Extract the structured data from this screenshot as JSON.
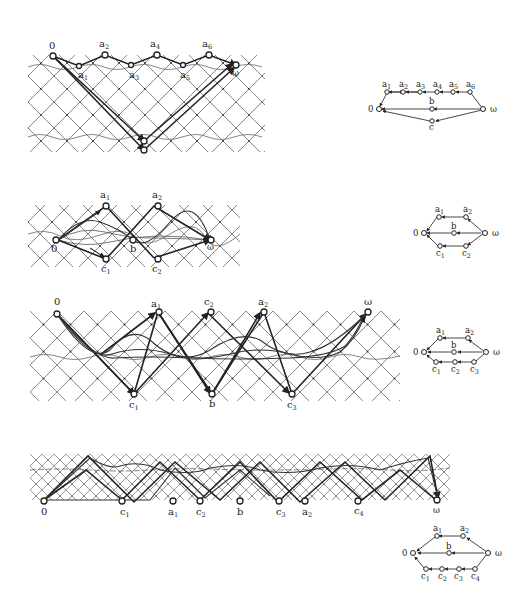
{
  "figures": [
    {
      "id": "fig1",
      "lattice": {
        "top_labels": [
          "0",
          "a2",
          "a4",
          "a6"
        ],
        "bottom_labels_row1": [
          "a1",
          "a3",
          "a5"
        ],
        "end_label": "ω",
        "bottom_nodes": 2
      },
      "graph": {
        "nodes": [
          "0",
          "a1",
          "a2",
          "a3",
          "a4",
          "a5",
          "a6",
          "b",
          "c",
          "ω"
        ],
        "labels": {
          "zero": "0",
          "omega": "ω",
          "b": "b",
          "c": "c",
          "a1": "a",
          "a1_sub": "1",
          "a2": "a",
          "a2_sub": "2",
          "a3": "a",
          "a3_sub": "3",
          "a4": "a",
          "a4_sub": "4",
          "a5": "a",
          "a5_sub": "5",
          "a6": "a",
          "a6_sub": "6"
        }
      }
    },
    {
      "id": "fig2",
      "lattice": {
        "labels": {
          "zero": "0",
          "omega": "ω",
          "b": "b",
          "a1": "a",
          "a1_sub": "1",
          "a2": "a",
          "a2_sub": "2",
          "c1": "c",
          "c1_sub": "1",
          "c2": "c",
          "c2_sub": "2"
        }
      },
      "graph": {
        "nodes": [
          "0",
          "a1",
          "a2",
          "b",
          "c1",
          "c2",
          "ω"
        ],
        "labels": {
          "zero": "0",
          "omega": "ω",
          "b": "b",
          "a1": "a",
          "a1_sub": "1",
          "a2": "a",
          "a2_sub": "2",
          "c1": "c",
          "c1_sub": "1",
          "c2": "c",
          "c2_sub": "2"
        }
      }
    },
    {
      "id": "fig3",
      "lattice": {
        "labels": {
          "zero": "0",
          "omega": "ω",
          "b": "b",
          "a1": "a",
          "a1_sub": "1",
          "a2": "a",
          "a2_sub": "2",
          "c1": "c",
          "c1_sub": "1",
          "c2": "c",
          "c2_sub": "2",
          "c3": "c",
          "c3_sub": "3"
        }
      },
      "graph": {
        "nodes": [
          "0",
          "a1",
          "a2",
          "b",
          "c1",
          "c2",
          "c3",
          "ω"
        ],
        "labels": {
          "zero": "0",
          "omega": "ω",
          "b": "b",
          "a1": "a",
          "a1_sub": "1",
          "a2": "a",
          "a2_sub": "2",
          "c1": "c",
          "c1_sub": "1",
          "c2": "c",
          "c2_sub": "2",
          "c3": "c",
          "c3_sub": "3"
        }
      }
    },
    {
      "id": "fig4",
      "lattice": {
        "labels": {
          "zero": "0",
          "omega": "ω",
          "b": "b",
          "a1": "a",
          "a1_sub": "1",
          "a2": "a",
          "a2_sub": "2",
          "c1": "c",
          "c1_sub": "1",
          "c2": "c",
          "c2_sub": "2",
          "c3": "c",
          "c3_sub": "3",
          "c4": "c",
          "c4_sub": "4"
        }
      },
      "graph": {
        "nodes": [
          "0",
          "a1",
          "a2",
          "b",
          "c1",
          "c2",
          "c3",
          "c4",
          "ω"
        ],
        "labels": {
          "zero": "0",
          "omega": "ω",
          "b": "b",
          "a1": "a",
          "a1_sub": "1",
          "a2": "a",
          "a2_sub": "2",
          "c1": "c",
          "c1_sub": "1",
          "c2": "c",
          "c2_sub": "2",
          "c3": "c",
          "c3_sub": "3",
          "c4": "c",
          "c4_sub": "4"
        }
      }
    }
  ]
}
